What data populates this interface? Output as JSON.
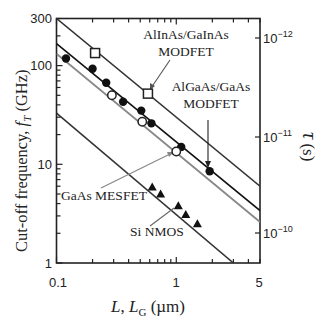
{
  "chart_data": {
    "type": "scatter",
    "title": "",
    "xlabel": "L, L_G (µm)",
    "ylabel": "Cut-off frequency, f_T (GHz)",
    "y2label": "τ (s)",
    "xscale": "log",
    "yscale": "log",
    "xlim": [
      0.1,
      5
    ],
    "ylim": [
      1,
      300
    ],
    "x_ticks": [
      "0.1",
      "1",
      "5"
    ],
    "y_ticks": [
      "1",
      "10",
      "100",
      "300"
    ],
    "y2_ticks": [
      "10^-12",
      "10^-11",
      "10^-10"
    ],
    "grid": false,
    "series": [
      {
        "name": "AlInAs/GaInAs MODFET",
        "marker": "open-square",
        "points": [
          [
            0.21,
            134
          ],
          [
            0.58,
            52
          ]
        ],
        "fit_line": {
          "x": [
            0.1,
            5
          ],
          "y": [
            300,
            6
          ]
        },
        "line_color": "#333333"
      },
      {
        "name": "AlGaAs/GaAs MODFET",
        "marker": "filled-circle",
        "points": [
          [
            0.12,
            118
          ],
          [
            0.2,
            93
          ],
          [
            0.26,
            67
          ],
          [
            0.36,
            43
          ],
          [
            0.51,
            35
          ],
          [
            0.62,
            26
          ],
          [
            1.1,
            15
          ],
          [
            1.9,
            8.5
          ]
        ],
        "fit_line": {
          "x": [
            0.1,
            5
          ],
          "y": [
            167,
            3.4
          ]
        },
        "line_color": "#111111"
      },
      {
        "name": "GaAs MESFET",
        "marker": "open-circle",
        "points": [
          [
            0.29,
            50
          ],
          [
            0.52,
            27
          ],
          [
            1.0,
            13.5
          ]
        ],
        "fit_line": {
          "x": [
            0.1,
            5
          ],
          "y": [
            132,
            2.6
          ]
        },
        "line_color": "#888888"
      },
      {
        "name": "Si NMOS",
        "marker": "filled-triangle",
        "points": [
          [
            0.63,
            5.9
          ],
          [
            0.74,
            5.0
          ],
          [
            1.04,
            3.8
          ],
          [
            1.2,
            3.1
          ],
          [
            1.5,
            2.5
          ]
        ],
        "fit_line": {
          "x": [
            0.1,
            3.0
          ],
          "y": [
            33,
            1
          ]
        },
        "line_color": "#333333"
      }
    ],
    "annotations": [
      {
        "text_lines": [
          "AlInAs/GaInAs",
          "MODFET"
        ],
        "points_to": [
          0.58,
          52
        ]
      },
      {
        "text_lines": [
          "AlGaAs/GaAs",
          "MODFET"
        ],
        "points_to": [
          1.9,
          8.5
        ]
      },
      {
        "text": "GaAs MESFET",
        "points_to": [
          1.0,
          13.5
        ]
      },
      {
        "text": "Si NMOS",
        "points_to": [
          1.04,
          3.8
        ]
      }
    ]
  },
  "labels": {
    "ylabel_main": "Cut-off frequency, ",
    "ylabel_f": "f",
    "ylabel_T": "T",
    "ylabel_unit": " (GHz)",
    "xlabel_L": "L",
    "xlabel_comma": ", ",
    "xlabel_LG": "L",
    "xlabel_G": "G",
    "xlabel_unit": " (µm)",
    "y2label_tau": "τ",
    "y2label_unit": " (s)",
    "x_tick_0": "0.1",
    "x_tick_1": "1",
    "x_tick_2": "5",
    "y_tick_0": "1",
    "y_tick_1": "10",
    "y_tick_2": "100",
    "y_tick_3": "300",
    "y2_base": "10",
    "y2_exp_0": "−12",
    "y2_exp_1": "−11",
    "y2_exp_2": "−10",
    "ann_alinas_1": "AlInAs/GaInAs",
    "ann_alinas_2": "MODFET",
    "ann_algaas_1": "AlGaAs/GaAs",
    "ann_algaas_2": "MODFET",
    "ann_mesfet": "GaAs MESFET",
    "ann_nmos": "Si NMOS"
  }
}
